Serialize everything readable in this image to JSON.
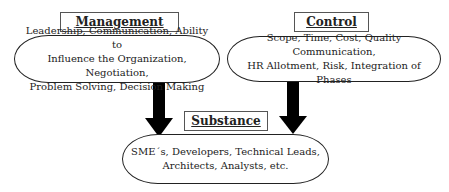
{
  "diagram": {
    "management": {
      "title": "Management",
      "lines": [
        "Leadership, Communication, Ability to",
        "Influence the Organization,  Negotiation,",
        "Problem Solving, Decision Making"
      ]
    },
    "control": {
      "title": "Control",
      "lines": [
        "Scope, Time, Cost, Quality Communication,",
        "HR Allotment, Risk, Integration of Phases"
      ]
    },
    "substance": {
      "title": "Substance",
      "lines": [
        "SME´s, Developers, Technical Leads,",
        "Architects, Analysts, etc."
      ]
    },
    "arrows": [
      {
        "from": "management",
        "to": "substance"
      },
      {
        "from": "control",
        "to": "substance"
      }
    ]
  }
}
